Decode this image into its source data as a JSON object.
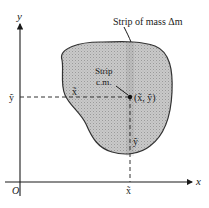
{
  "diagram": {
    "axes": {
      "x_label": "x",
      "y_label": "y",
      "origin_label": "O"
    },
    "region": {
      "fill_color": "#c8c8c8",
      "stroke_color": "#333333"
    },
    "labels": {
      "strip_of_mass": "Strip of mass Δm",
      "strip_cm_line1": "Strip",
      "strip_cm_line2": "c.m.",
      "point_coords": "(x̃, ỹ)",
      "x_tilde_on_dashed": "x̃",
      "y_tilde_on_dashed": "ỹ",
      "y_tilde_axis": "ỹ",
      "x_tilde_axis": "x̃"
    },
    "colors": {
      "line": "#1a1a1a",
      "background": "#ffffff"
    }
  }
}
